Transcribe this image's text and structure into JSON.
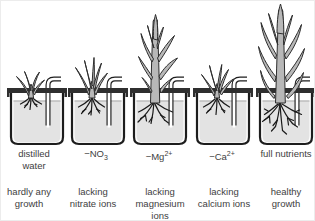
{
  "beakers": [
    {
      "label": "distilled\nwater",
      "caption": "hardly any\ngrowth"
    },
    {
      "label_pre": "−NO",
      "label_sub": "3",
      "caption": "lacking\nnitrate ions"
    },
    {
      "label_pre": "−Mg",
      "label_sup": "2+",
      "caption": "lacking\nmagnesium\nions"
    },
    {
      "label_pre": "−Ca",
      "label_sup": "2+",
      "caption": "lacking\ncalcium ions"
    },
    {
      "label": "full nutrients",
      "caption": "healthy\ngrowth"
    }
  ],
  "colors": {
    "plant_fill": "#b8b8b8",
    "water_fill": "#e3e3e3",
    "outline": "#2d2d2d",
    "outline_strong": "#1d1d1d",
    "lid": "#2f2f2f",
    "root": "#1a1a1a",
    "text": "#3e3e3e"
  }
}
